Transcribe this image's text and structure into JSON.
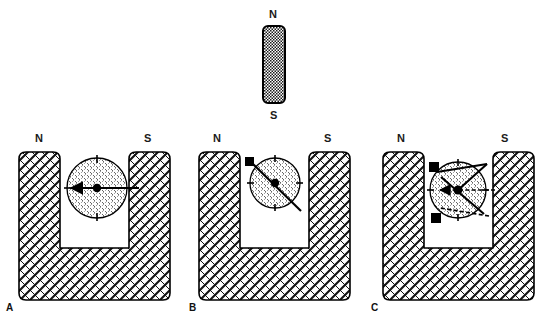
{
  "figure": {
    "background_color": "#ffffff",
    "line_color": "#000000",
    "label_color": "#1a1a1a"
  },
  "bar_magnet": {
    "name": "vertical-bar-magnet",
    "north_label": "N",
    "south_label": "S",
    "x": 263,
    "y": 26,
    "width": 22,
    "height": 77,
    "fill_pattern": "dense-dot-checker",
    "north_label_x": 274,
    "north_label_y": 14,
    "south_label_x": 274,
    "south_label_y": 114
  },
  "panels": [
    {
      "id": "A",
      "letter": "A",
      "letter_x": 6,
      "letter_y": 306,
      "origin_x": 0,
      "north_label": "N",
      "south_label": "S",
      "north_label_x": 40,
      "north_label_y": 138,
      "south_label_x": 148,
      "south_label_y": 138,
      "magnet": {
        "left": 19,
        "top": 152,
        "width": 151,
        "height": 148,
        "arm_width": 41,
        "gap_bottom": 248,
        "corner_radius": 7
      },
      "compass": {
        "cx": 97,
        "cy": 188,
        "r": 30,
        "needles": [
          {
            "name": "needle-horizontal-left",
            "angle_deg": 180,
            "length": 42,
            "style": "solid",
            "head": "arrow",
            "tail": "none"
          }
        ],
        "tick_marks": 4
      }
    },
    {
      "id": "B",
      "letter": "B",
      "letter_x": 190,
      "letter_y": 306,
      "origin_x": 185,
      "north_label": "N",
      "south_label": "S",
      "north_label_x": 217,
      "north_label_y": 138,
      "south_label_x": 327,
      "south_label_y": 138,
      "magnet": {
        "left": 199,
        "top": 152,
        "width": 151,
        "height": 148,
        "arm_width": 41,
        "gap_bottom": 248,
        "corner_radius": 7
      },
      "compass": {
        "cx": 275,
        "cy": 183,
        "r": 25,
        "needles": [
          {
            "name": "needle-diagonal-nw",
            "angle_deg": 215,
            "length": 46,
            "style": "solid",
            "head": "square",
            "tail": "line"
          }
        ],
        "tick_marks": 4
      }
    },
    {
      "id": "C",
      "letter": "C",
      "letter_x": 372,
      "letter_y": 306,
      "origin_x": 370,
      "north_label": "N",
      "south_label": "S",
      "north_label_x": 400,
      "north_label_y": 138,
      "south_label_x": 504,
      "south_label_y": 138,
      "magnet": {
        "left": 383,
        "top": 152,
        "width": 151,
        "height": 148,
        "arm_width": 41,
        "gap_bottom": 248,
        "corner_radius": 7
      },
      "compass": {
        "cx": 458,
        "cy": 190,
        "r": 28,
        "needles": [
          {
            "name": "needle-horizontal-left",
            "angle_deg": 180,
            "length": 44,
            "style": "dashed",
            "head": "arrow",
            "tail": "line"
          },
          {
            "name": "needle-diagonal-nw-upper",
            "angle_deg": 205,
            "length": 48,
            "style": "dashed",
            "head": "square",
            "tail": "line"
          },
          {
            "name": "needle-diagonal-sw-lower",
            "angle_deg": 152,
            "length": 48,
            "style": "dashed",
            "head": "square",
            "tail": "line"
          }
        ],
        "tick_marks": 4
      }
    }
  ]
}
